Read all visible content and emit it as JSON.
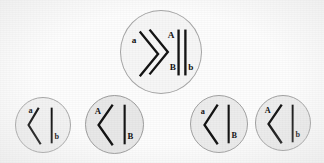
{
  "figure": {
    "kind": "meiosis-independent-assortment-diagram",
    "background_color": "#fdfdfd",
    "cell_fill_color": "#efefef",
    "cell_outline_color": "#9a9a9a",
    "chromosome_color": "#141414"
  },
  "parent_cell": {
    "name": "parent-cell",
    "fill": "#f6f6f6",
    "outline": "#a6a6a6",
    "chromosome_pairs": [
      {
        "shape": "bent",
        "name": "chromosome-pair-A",
        "labels": [
          {
            "text": "a",
            "position": "outer-left"
          },
          {
            "text": "A",
            "position": "inner-right"
          }
        ]
      },
      {
        "shape": "straight",
        "name": "chromosome-pair-B",
        "labels": [
          {
            "text": "B",
            "position": "lower-left"
          },
          {
            "text": "b",
            "position": "lower-right"
          }
        ]
      }
    ]
  },
  "gametes": [
    {
      "name": "gamete-ab",
      "genotype": "ab",
      "fill": "#f2f2f2",
      "outline": "#a8a8a8",
      "bent_chromosome": {
        "shape": "bent",
        "label": "a",
        "label_position": "upper-left"
      },
      "straight_chromosome": {
        "shape": "straight",
        "label": "b",
        "label_position": "lower-right"
      }
    },
    {
      "name": "gamete-AB",
      "genotype": "AB",
      "fill": "#e8e8e8",
      "outline": "#9c9c9c",
      "bent_chromosome": {
        "shape": "bent",
        "label": "A",
        "label_position": "upper-left"
      },
      "straight_chromosome": {
        "shape": "straight",
        "label": "B",
        "label_position": "lower-right"
      }
    },
    {
      "name": "gamete-aB",
      "genotype": "aB",
      "fill": "#ececec",
      "outline": "#a2a2a2",
      "bent_chromosome": {
        "shape": "bent",
        "label": "a",
        "label_position": "upper-left"
      },
      "straight_chromosome": {
        "shape": "straight",
        "label": "B",
        "label_position": "lower-right"
      }
    },
    {
      "name": "gamete-Ab",
      "genotype": "Ab",
      "fill": "#ededed",
      "outline": "#a2a2a2",
      "bent_chromosome": {
        "shape": "bent",
        "label": "A",
        "label_position": "upper-left"
      },
      "straight_chromosome": {
        "shape": "straight",
        "label": "b",
        "label_position": "lower-right"
      }
    }
  ]
}
